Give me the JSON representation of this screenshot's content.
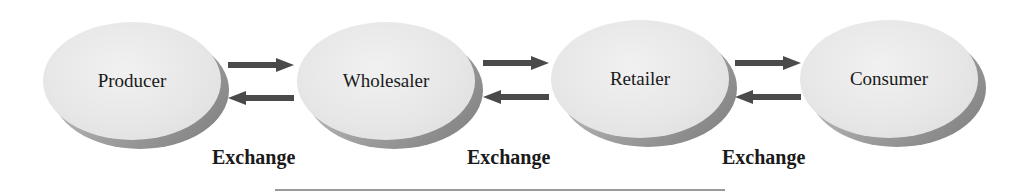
{
  "diagram": {
    "nodes": [
      {
        "label": "Producer"
      },
      {
        "label": "Wholesaler"
      },
      {
        "label": "Retailer"
      },
      {
        "label": "Consumer"
      }
    ],
    "exchanges": [
      {
        "label": "Exchange"
      },
      {
        "label": "Exchange"
      },
      {
        "label": "Exchange"
      }
    ],
    "colors": {
      "arrow": "#4a4a4a",
      "node_face": "#e8e8e8",
      "node_shadow": "#9a9a9a",
      "text": "#1a1a1a"
    }
  }
}
